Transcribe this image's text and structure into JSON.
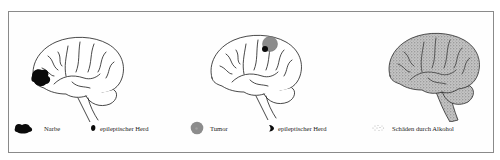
{
  "figure": {
    "panels": [
      {
        "id": "scar",
        "description": "Brain with scar in frontal lobe",
        "legend": [
          {
            "symbol": "scar-black-blob",
            "label": "Narbe"
          },
          {
            "symbol": "epileptic-focus",
            "label": "epileptischer Herd"
          }
        ]
      },
      {
        "id": "tumor",
        "description": "Brain with tumor and epileptic focus in parietal region",
        "legend": [
          {
            "symbol": "tumor-gray-circle",
            "label": "Tumor"
          },
          {
            "symbol": "epileptic-focus",
            "label": "epileptischer Herd"
          }
        ]
      },
      {
        "id": "alcohol",
        "description": "Brain fully stippled indicating diffuse alcohol damage",
        "legend": [
          {
            "symbol": "stipple-pattern",
            "label": "Schäden durch Alkohol"
          }
        ]
      }
    ],
    "colors": {
      "outline": "#1a1a1a",
      "scar": "#0a0a0a",
      "tumor": "#8c8c8c",
      "stipple": "#a8a8a8",
      "frame": "#8a8a8a"
    }
  }
}
